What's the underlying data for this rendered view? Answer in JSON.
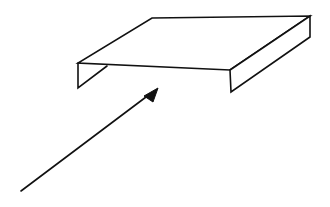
{
  "diagram": {
    "type": "line-drawing",
    "colors": {
      "background": "#ffffff",
      "line": "#111111"
    },
    "shapes": {
      "top_face": [
        [
          152,
          18
        ],
        [
          310,
          16
        ],
        [
          230,
          70
        ],
        [
          78,
          63
        ]
      ],
      "left_flange": [
        [
          78,
          63
        ],
        [
          78,
          88
        ],
        [
          107,
          66
        ]
      ],
      "right_flange": [
        [
          230,
          70
        ],
        [
          231,
          92
        ],
        [
          310,
          37
        ],
        [
          310,
          16
        ]
      ],
      "arrow": {
        "start": [
          21,
          191
        ],
        "tip": [
          158,
          88
        ],
        "head_left": [
          144,
          96
        ],
        "head_right": [
          153,
          102
        ]
      }
    }
  }
}
